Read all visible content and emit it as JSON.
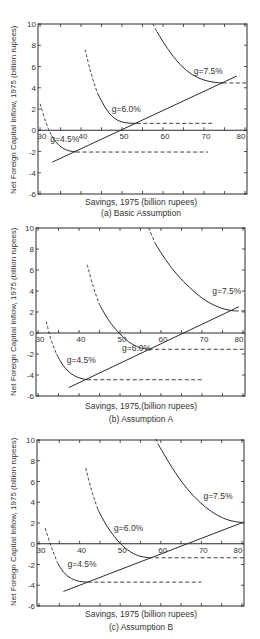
{
  "figure": {
    "ylabel": "Net Foreign Capital Inflow, 1975 (billion rupees)",
    "colors": {
      "ink": "#2b2b2b",
      "background": "#ffffff"
    }
  },
  "chart_data": [
    {
      "type": "line",
      "id": "a",
      "caption": "(a) Basic Assumption",
      "xlabel": "Savings, 1975 (billion rupees)",
      "ylabel": "Net Foreign Capital Inflow, 1975 (billion rupees)",
      "xlim": [
        29.5,
        80.5
      ],
      "ylim": [
        -6,
        10
      ],
      "xticks": [
        30,
        40,
        50,
        60,
        70,
        80
      ],
      "yticks": [
        -6,
        -4,
        -2,
        0,
        2,
        4,
        6,
        8,
        10
      ],
      "x_tick_labels_at_zero_line": true,
      "box": {
        "left": 38,
        "top": 24,
        "right": 247,
        "bottom": 194
      },
      "series": [
        {
          "name": "g=4.5%",
          "label_pos": [
            32.5,
            -1.1
          ],
          "dashed_part": [
            [
              30,
              2.5
            ],
            [
              31.5,
              0.6
            ],
            [
              32.8,
              -0.5
            ]
          ],
          "solid_part": [
            [
              32.8,
              -0.5
            ],
            [
              34,
              -1.2
            ],
            [
              35.5,
              -1.7
            ],
            [
              37,
              -1.95
            ],
            [
              38.8,
              -2.05
            ]
          ],
          "min_point": [
            38.8,
            -2.05
          ],
          "flat_line_to": 71
        },
        {
          "name": "g=6.0%",
          "label_pos": [
            47.5,
            1.7
          ],
          "dashed_part": [
            [
              41,
              7.6
            ],
            [
              42.5,
              5.2
            ],
            [
              44,
              3.5
            ]
          ],
          "solid_part": [
            [
              44,
              3.5
            ],
            [
              46,
              2.0
            ],
            [
              48,
              1.1
            ],
            [
              50,
              0.75
            ],
            [
              52,
              0.65
            ],
            [
              53.6,
              0.65
            ]
          ],
          "min_point": [
            53.6,
            0.65
          ],
          "flat_line_to": 72
        },
        {
          "name": "g=7.5%",
          "label_pos": [
            67.5,
            5.3
          ],
          "dashed_part": [
            [
              57.5,
              10
            ],
            [
              58.5,
              9.3
            ]
          ],
          "solid_part": [
            [
              58.5,
              9.3
            ],
            [
              61,
              7.7
            ],
            [
              64,
              6.2
            ],
            [
              67,
              5.2
            ],
            [
              70,
              4.7
            ],
            [
              72.5,
              4.5
            ],
            [
              74.6,
              4.45
            ]
          ],
          "min_point": [
            74.6,
            4.45
          ],
          "flat_line_to": 80.5
        }
      ],
      "envelope_line": {
        "from": [
          33,
          -3
        ],
        "to": [
          78,
          5.1
        ]
      }
    },
    {
      "type": "line",
      "id": "b",
      "caption": "(b) Assumption A",
      "xlabel": "Savings, 1975,(billion rupees)",
      "ylabel": "Net Foreign Capital Inflow, 1975 (billion rupees)",
      "xlim": [
        29.5,
        80.5
      ],
      "ylim": [
        -6,
        10
      ],
      "xticks": [
        30,
        40,
        50,
        60,
        70,
        80
      ],
      "yticks": [
        -6,
        -4,
        -2,
        0,
        2,
        4,
        6,
        8,
        10
      ],
      "box": {
        "left": 36,
        "top": 228,
        "right": 245,
        "bottom": 396
      },
      "series": [
        {
          "name": "g=4.5%",
          "label_pos": [
            37,
            -2.9
          ],
          "dashed_part": [
            [
              32,
              1.1
            ],
            [
              33,
              -0.5
            ],
            [
              34.5,
              -2.0
            ]
          ],
          "solid_part": [
            [
              34.5,
              -2.0
            ],
            [
              36,
              -3.1
            ],
            [
              38,
              -3.9
            ],
            [
              40,
              -4.3
            ],
            [
              42,
              -4.45
            ]
          ],
          "min_point": [
            42,
            -4.45
          ],
          "flat_line_to": 70
        },
        {
          "name": "g=6.0%",
          "label_pos": [
            50.5,
            -1.7
          ],
          "dashed_part": [
            [
              42,
              6.5
            ],
            [
              43.5,
              4.3
            ],
            [
              45,
              2.7
            ]
          ],
          "solid_part": [
            [
              45,
              2.7
            ],
            [
              47,
              1.3
            ],
            [
              49,
              0.3
            ],
            [
              51,
              -0.5
            ],
            [
              53,
              -1.1
            ],
            [
              55,
              -1.45
            ],
            [
              57,
              -1.55
            ]
          ],
          "min_point": [
            57,
            -1.55
          ],
          "flat_line_to": 80.5
        },
        {
          "name": "g=7.5%",
          "label_pos": [
            72.5,
            3.7
          ],
          "dashed_part": [
            [
              57,
              10
            ],
            [
              58.5,
              8.6
            ]
          ],
          "solid_part": [
            [
              58.5,
              8.6
            ],
            [
              61,
              7.0
            ],
            [
              64,
              5.5
            ],
            [
              67,
              4.3
            ],
            [
              70,
              3.3
            ],
            [
              73,
              2.6
            ],
            [
              76,
              2.2
            ],
            [
              78,
              2.1
            ]
          ],
          "min_point": [
            78,
            2.1
          ],
          "flat_line_to": 80.5
        },
        {
          "name": "envelope",
          "label_pos": null
        }
      ],
      "envelope_line": {
        "from": [
          37.5,
          -5.2
        ],
        "to": [
          79,
          2.5
        ]
      }
    },
    {
      "type": "line",
      "id": "c",
      "caption": "(c) Assumption B",
      "xlabel": "Savings, 1975 (billion rupees)",
      "ylabel": "Net Foreign Capital Inflow, 1975 (billion rupees)",
      "xlim": [
        29.5,
        80.5
      ],
      "ylim": [
        -6,
        10
      ],
      "xticks": [
        30,
        40,
        50,
        60,
        70,
        80
      ],
      "yticks": [
        -6,
        -4,
        -2,
        0,
        2,
        4,
        6,
        8,
        10
      ],
      "box": {
        "left": 37,
        "top": 440,
        "right": 244,
        "bottom": 606
      },
      "series": [
        {
          "name": "g=4.5%",
          "label_pos": [
            37,
            -2.2
          ],
          "dashed_part": [
            [
              31.5,
              1.5
            ],
            [
              33,
              -0.3
            ],
            [
              34.5,
              -1.8
            ]
          ],
          "solid_part": [
            [
              34.5,
              -1.8
            ],
            [
              36,
              -2.8
            ],
            [
              38,
              -3.4
            ],
            [
              40,
              -3.65
            ],
            [
              42,
              -3.7
            ]
          ],
          "min_point": [
            42,
            -3.7
          ],
          "flat_line_to": 70
        },
        {
          "name": "g=6.0%",
          "label_pos": [
            48.5,
            1.2
          ],
          "dashed_part": [
            [
              41.5,
              7.3
            ],
            [
              43,
              5.0
            ],
            [
              44.5,
              3.3
            ]
          ],
          "solid_part": [
            [
              44.5,
              3.3
            ],
            [
              46.5,
              1.8
            ],
            [
              48.5,
              0.7
            ],
            [
              50.5,
              -0.2
            ],
            [
              52.5,
              -0.8
            ],
            [
              54.5,
              -1.2
            ],
            [
              57,
              -1.35
            ]
          ],
          "min_point": [
            57,
            -1.35
          ],
          "flat_line_to": 80.5
        },
        {
          "name": "g=7.5%",
          "label_pos": [
            70.5,
            4.3
          ],
          "dashed_part": [
            [
              59.5,
              9.5
            ]
          ],
          "solid_part": [
            [
              59.5,
              9.5
            ],
            [
              62,
              7.8
            ],
            [
              65,
              6.0
            ],
            [
              68,
              4.6
            ],
            [
              71,
              3.5
            ],
            [
              74,
              2.7
            ],
            [
              77,
              2.2
            ],
            [
              80,
              2.05
            ]
          ],
          "min_point": [
            80,
            2.05
          ],
          "flat_line_to": 80.5
        }
      ],
      "envelope_line": {
        "from": [
          36,
          -4.6
        ],
        "to": [
          80.5,
          2.1
        ]
      }
    }
  ]
}
